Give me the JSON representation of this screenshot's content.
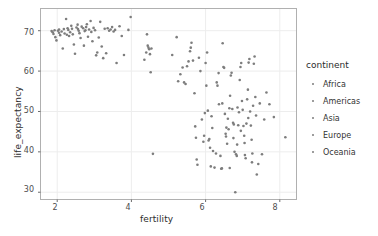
{
  "chart_data": {
    "type": "scatter",
    "title": "",
    "xlabel": "fertility",
    "ylabel": "life_expectancy",
    "xlim": [
      1.55,
      8.45
    ],
    "ylim": [
      28.2,
      75.5
    ],
    "xticks": [
      2,
      4,
      6,
      8
    ],
    "yticks": [
      30,
      40,
      50,
      60,
      70
    ],
    "grid": true,
    "legend": {
      "title": "continent",
      "position": "right",
      "entries": [
        "Africa",
        "Americas",
        "Asia",
        "Europe",
        "Oceania"
      ]
    },
    "point_color": "#7d7d7d",
    "point_size": 2.6,
    "series": [
      {
        "name": "countries",
        "points": [
          [
            1.85,
            69.9
          ],
          [
            1.88,
            69.6
          ],
          [
            1.9,
            69.2
          ],
          [
            1.93,
            70.1
          ],
          [
            1.95,
            68.4
          ],
          [
            1.98,
            67.6
          ],
          [
            2.02,
            70.0
          ],
          [
            2.05,
            69.5
          ],
          [
            2.08,
            68.9
          ],
          [
            2.12,
            69.8
          ],
          [
            2.15,
            65.6
          ],
          [
            2.18,
            70.4
          ],
          [
            2.2,
            69.3
          ],
          [
            2.24,
            72.9
          ],
          [
            2.26,
            69.0
          ],
          [
            2.3,
            70.2
          ],
          [
            2.32,
            68.7
          ],
          [
            2.35,
            69.6
          ],
          [
            2.38,
            71.2
          ],
          [
            2.4,
            70.5
          ],
          [
            2.42,
            69.1
          ],
          [
            2.45,
            66.6
          ],
          [
            2.48,
            64.3
          ],
          [
            2.52,
            70.8
          ],
          [
            2.55,
            71.5
          ],
          [
            2.58,
            70.0
          ],
          [
            2.6,
            69.4
          ],
          [
            2.63,
            68.2
          ],
          [
            2.66,
            71.0
          ],
          [
            2.7,
            70.6
          ],
          [
            2.72,
            66.3
          ],
          [
            2.74,
            69.9
          ],
          [
            2.78,
            70.9
          ],
          [
            2.8,
            71.6
          ],
          [
            2.83,
            68.5
          ],
          [
            2.86,
            70.3
          ],
          [
            2.9,
            72.4
          ],
          [
            2.92,
            69.7
          ],
          [
            2.95,
            67.4
          ],
          [
            2.98,
            70.7
          ],
          [
            3.02,
            70.1
          ],
          [
            3.05,
            63.9
          ],
          [
            3.08,
            64.6
          ],
          [
            3.12,
            68.3
          ],
          [
            3.16,
            72.2
          ],
          [
            3.2,
            66.1
          ],
          [
            3.24,
            63.2
          ],
          [
            3.28,
            70.5
          ],
          [
            3.32,
            64.4
          ],
          [
            3.36,
            70.6
          ],
          [
            3.4,
            70.0
          ],
          [
            3.44,
            70.3
          ],
          [
            3.48,
            70.9
          ],
          [
            3.52,
            69.8
          ],
          [
            3.56,
            70.2
          ],
          [
            3.6,
            62.0
          ],
          [
            3.68,
            71.1
          ],
          [
            3.74,
            68.7
          ],
          [
            3.8,
            64.0
          ],
          [
            3.92,
            70.2
          ],
          [
            3.98,
            73.4
          ],
          [
            2.05,
            70.3
          ],
          [
            2.28,
            70.6
          ],
          [
            2.56,
            70.4
          ],
          [
            2.76,
            70.1
          ],
          [
            4.35,
            62.8
          ],
          [
            4.4,
            64.6
          ],
          [
            4.42,
            69.1
          ],
          [
            4.44,
            66.3
          ],
          [
            4.46,
            65.8
          ],
          [
            4.48,
            65.4
          ],
          [
            4.5,
            64.2
          ],
          [
            4.52,
            59.7
          ],
          [
            4.54,
            65.6
          ],
          [
            4.58,
            39.5
          ],
          [
            5.1,
            64.0
          ],
          [
            5.22,
            68.4
          ],
          [
            5.26,
            57.5
          ],
          [
            5.32,
            59.2
          ],
          [
            5.38,
            60.9
          ],
          [
            5.42,
            57.2
          ],
          [
            5.46,
            56.8
          ],
          [
            5.5,
            61.2
          ],
          [
            5.54,
            62.4
          ],
          [
            5.58,
            64.9
          ],
          [
            5.6,
            65.8
          ],
          [
            5.62,
            67.0
          ],
          [
            5.66,
            62.6
          ],
          [
            5.7,
            54.5
          ],
          [
            5.72,
            46.3
          ],
          [
            5.74,
            43.5
          ],
          [
            5.76,
            38.1
          ],
          [
            5.78,
            36.8
          ],
          [
            5.82,
            63.3
          ],
          [
            5.86,
            60.0
          ],
          [
            5.9,
            48.0
          ],
          [
            5.94,
            42.5
          ],
          [
            5.96,
            44.0
          ],
          [
            5.98,
            49.6
          ],
          [
            6.0,
            62.0
          ],
          [
            6.02,
            56.4
          ],
          [
            6.04,
            64.6
          ],
          [
            6.06,
            50.2
          ],
          [
            6.08,
            42.8
          ],
          [
            6.1,
            43.2
          ],
          [
            6.12,
            41.0
          ],
          [
            6.14,
            36.4
          ],
          [
            6.16,
            48.8
          ],
          [
            6.18,
            45.9
          ],
          [
            6.2,
            40.2
          ],
          [
            6.24,
            36.1
          ],
          [
            6.28,
            39.6
          ],
          [
            6.32,
            56.4
          ],
          [
            6.36,
            51.8
          ],
          [
            6.4,
            39.0
          ],
          [
            6.42,
            35.8
          ],
          [
            6.44,
            35.9
          ],
          [
            6.46,
            66.9
          ],
          [
            6.48,
            61.0
          ],
          [
            6.5,
            60.8
          ],
          [
            6.52,
            49.4
          ],
          [
            6.54,
            44.5
          ],
          [
            6.56,
            46.0
          ],
          [
            6.58,
            42.0
          ],
          [
            6.6,
            48.2
          ],
          [
            6.62,
            45.6
          ],
          [
            6.64,
            50.8
          ],
          [
            6.66,
            53.9
          ],
          [
            6.68,
            58.9
          ],
          [
            6.7,
            59.6
          ],
          [
            6.72,
            50.6
          ],
          [
            6.74,
            47.2
          ],
          [
            6.76,
            46.8
          ],
          [
            6.78,
            40.0
          ],
          [
            6.8,
            30.0
          ],
          [
            6.82,
            39.4
          ],
          [
            6.84,
            39.0
          ],
          [
            6.86,
            51.0
          ],
          [
            6.88,
            46.6
          ],
          [
            6.9,
            49.8
          ],
          [
            6.92,
            57.8
          ],
          [
            6.94,
            61.0
          ],
          [
            6.96,
            62.0
          ],
          [
            6.98,
            52.6
          ],
          [
            7.0,
            50.4
          ],
          [
            7.02,
            46.4
          ],
          [
            7.04,
            44.0
          ],
          [
            7.06,
            39.2
          ],
          [
            7.08,
            38.4
          ],
          [
            7.1,
            47.0
          ],
          [
            7.12,
            53.0
          ],
          [
            7.14,
            55.4
          ],
          [
            7.16,
            62.1
          ],
          [
            7.18,
            63.0
          ],
          [
            7.2,
            50.0
          ],
          [
            7.22,
            46.5
          ],
          [
            7.24,
            43.0
          ],
          [
            7.26,
            39.6
          ],
          [
            7.28,
            51.4
          ],
          [
            7.3,
            61.8
          ],
          [
            7.32,
            63.6
          ],
          [
            7.34,
            53.6
          ],
          [
            7.36,
            49.0
          ],
          [
            7.38,
            34.4
          ],
          [
            7.42,
            37.0
          ],
          [
            7.46,
            52.0
          ],
          [
            7.52,
            39.4
          ],
          [
            7.58,
            48.0
          ],
          [
            7.64,
            54.7
          ],
          [
            7.72,
            51.8
          ],
          [
            7.84,
            48.6
          ],
          [
            8.15,
            43.6
          ],
          [
            6.3,
            57.2
          ],
          [
            6.35,
            59.5
          ],
          [
            6.45,
            52.0
          ],
          [
            6.55,
            43.8
          ],
          [
            6.65,
            36.0
          ],
          [
            6.75,
            43.4
          ],
          [
            6.85,
            41.8
          ],
          [
            6.95,
            45.2
          ],
          [
            7.05,
            42.2
          ],
          [
            7.15,
            48.4
          ],
          [
            7.25,
            37.4
          ]
        ]
      }
    ]
  },
  "axes": {
    "y_tick_labels": [
      "70",
      "60",
      "50",
      "40",
      "30"
    ],
    "x_tick_labels": [
      "2",
      "4",
      "6",
      "8"
    ]
  }
}
